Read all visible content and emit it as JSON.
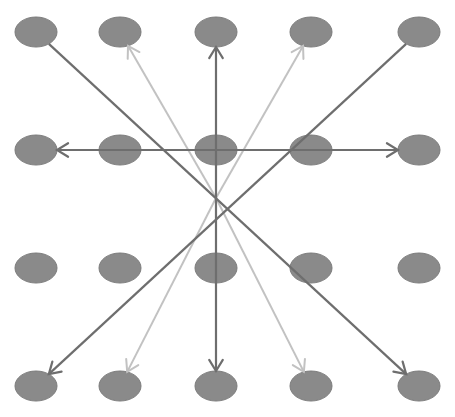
{
  "diagram": {
    "title": "",
    "grid": {
      "rows": 4,
      "cols": 5
    },
    "colors": {
      "node_fill": "#8a8a8a",
      "node_stroke": "#7c7c7c",
      "dark_arrow": "#6e6e6e",
      "light_arrow": "#c2c2c2"
    },
    "nodes": [
      {
        "id": "r1c1",
        "row": 1,
        "col": 1
      },
      {
        "id": "r1c2",
        "row": 1,
        "col": 2
      },
      {
        "id": "r1c3",
        "row": 1,
        "col": 3
      },
      {
        "id": "r1c4",
        "row": 1,
        "col": 4
      },
      {
        "id": "r1c5",
        "row": 1,
        "col": 5
      },
      {
        "id": "r2c1",
        "row": 2,
        "col": 1
      },
      {
        "id": "r2c2",
        "row": 2,
        "col": 2
      },
      {
        "id": "r2c3",
        "row": 2,
        "col": 3
      },
      {
        "id": "r2c4",
        "row": 2,
        "col": 4
      },
      {
        "id": "r2c5",
        "row": 2,
        "col": 5
      },
      {
        "id": "r3c1",
        "row": 3,
        "col": 1
      },
      {
        "id": "r3c2",
        "row": 3,
        "col": 2
      },
      {
        "id": "r3c3",
        "row": 3,
        "col": 3
      },
      {
        "id": "r3c4",
        "row": 3,
        "col": 4
      },
      {
        "id": "r3c5",
        "row": 3,
        "col": 5
      },
      {
        "id": "r4c1",
        "row": 4,
        "col": 1
      },
      {
        "id": "r4c2",
        "row": 4,
        "col": 2
      },
      {
        "id": "r4c3",
        "row": 4,
        "col": 3
      },
      {
        "id": "r4c4",
        "row": 4,
        "col": 4
      },
      {
        "id": "r4c5",
        "row": 4,
        "col": 5
      }
    ],
    "edges": [
      {
        "name": "diagonal-tl-to-br",
        "from": "r1c1",
        "to": "r4c5",
        "style": "dark",
        "arrow_start": false,
        "arrow_end": true
      },
      {
        "name": "diagonal-tr-to-bl",
        "from": "r1c5",
        "to": "r4c1",
        "style": "dark",
        "arrow_start": false,
        "arrow_end": true
      },
      {
        "name": "horizontal-left-right",
        "from": "r2c1",
        "to": "r2c5",
        "style": "dark",
        "arrow_start": true,
        "arrow_end": true
      },
      {
        "name": "vertical-up-down",
        "from": "r1c3",
        "to": "r4c3",
        "style": "dark",
        "arrow_start": true,
        "arrow_end": true
      },
      {
        "name": "light-to-r1c2",
        "from": "center",
        "to": "r1c2",
        "style": "light",
        "arrow_start": false,
        "arrow_end": true
      },
      {
        "name": "light-to-r1c4",
        "from": "center",
        "to": "r1c4",
        "style": "light",
        "arrow_start": false,
        "arrow_end": true
      },
      {
        "name": "light-to-r4c2",
        "from": "center",
        "to": "r4c2",
        "style": "light",
        "arrow_start": false,
        "arrow_end": true
      },
      {
        "name": "light-to-r4c4",
        "from": "center",
        "to": "r4c4",
        "style": "light",
        "arrow_start": false,
        "arrow_end": true
      }
    ]
  }
}
